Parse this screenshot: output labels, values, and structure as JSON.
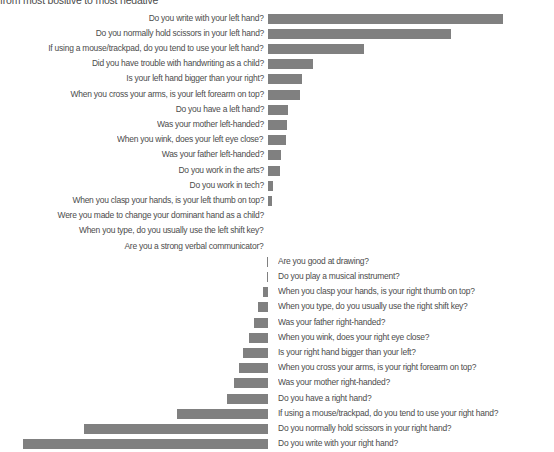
{
  "title": "from most positive to most negative",
  "axis": {
    "zero_x": 267.7,
    "row_pitch": 15.2,
    "first_row_top": 11.0,
    "bar_height": 10,
    "px_per_unit": 1.0
  },
  "colors": {
    "bar": "#808080",
    "text": "#4c4c4c",
    "background": "#ffffff"
  },
  "chart_data": {
    "type": "bar",
    "orientation": "horizontal-diverging",
    "title": "from most positive to most negative",
    "xlabel": "",
    "ylabel": "",
    "grid": false,
    "legend": null,
    "value_unit": "pixels (relative correlation magnitude)",
    "categories": [
      "Do you write with your left hand?",
      "Do you normally hold scissors in your left hand?",
      "If using a mouse/trackpad, do you tend to use your left hand?",
      "Did you have trouble with handwriting as a child?",
      "Is your left hand bigger than your right?",
      "When you cross your arms, is your left forearm on top?",
      "Do you have a left hand?",
      "Was your mother left-handed?",
      "When you wink, does your left eye close?",
      "Was your father left-handed?",
      "Do you work in the arts?",
      "Do you work in tech?",
      "When you clasp your hands, is your left thumb on top?",
      "Were you made to change your dominant hand as a child?",
      "When you type, do you usually use the left shift key?",
      "Are you a strong verbal communicator?",
      "Are you good at drawing?",
      "Do you play a musical instrument?",
      "When you clasp your hands, is your right thumb on top?",
      "When you type, do you usually use the right shift key?",
      "Was your father right-handed?",
      "When you wink, does your right eye close?",
      "Is your right hand bigger than your left?",
      "When you cross your arms, is your right forearm on top?",
      "Was your mother right-handed?",
      "Do you have a right hand?",
      "If using a mouse/trackpad, do you tend to use your right hand?",
      "Do you normally hold scissors in your right hand?",
      "Do you write with your right hand?"
    ],
    "values": [
      235,
      183,
      96,
      45,
      34,
      32,
      20,
      19,
      18,
      13,
      12,
      5,
      4,
      0,
      0,
      0,
      -1,
      -1,
      -5,
      -10,
      -14,
      -19,
      -25,
      -29,
      -34,
      -41,
      -91,
      -184,
      -245
    ]
  }
}
